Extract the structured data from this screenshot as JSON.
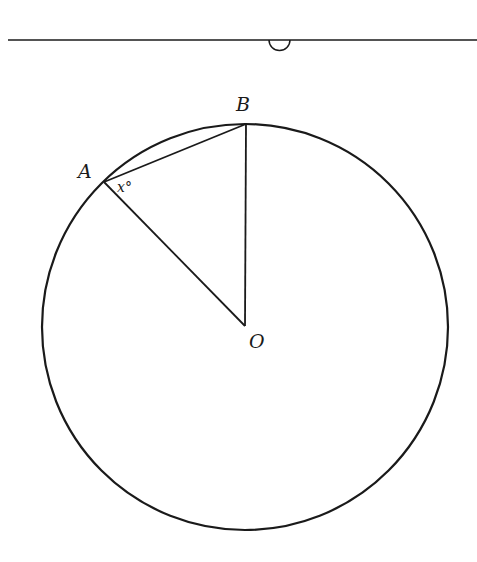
{
  "diagram": {
    "title": "",
    "labels": {
      "A": "A",
      "B": "B",
      "O": "O",
      "angle": "x°"
    },
    "colors": {
      "stroke": "#1a1a1a",
      "background": "#ffffff"
    },
    "elements": [
      "horizontal separator line with small semicircle notch",
      "circle centered at O",
      "chord AB",
      "radius OA",
      "radius OB (vertical)",
      "angle x° at vertex A between AB and AO"
    ]
  }
}
